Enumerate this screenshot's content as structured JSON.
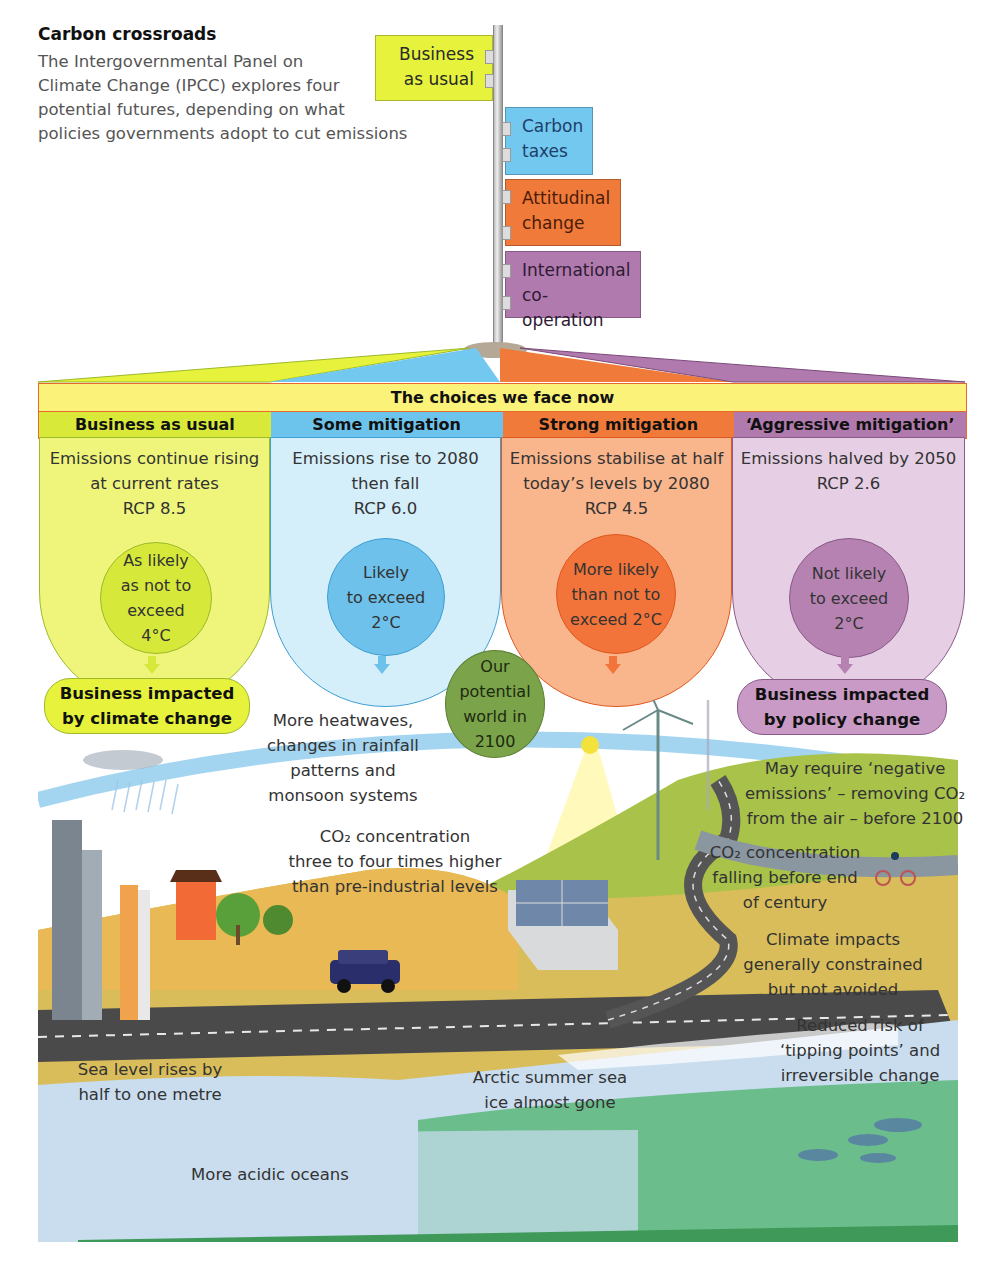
{
  "header": {
    "title": "Carbon crossroads",
    "intro_lines": [
      "The Intergovernmental Panel on",
      "Climate Change (IPCC) explores four",
      "potential futures, depending on what",
      "policies governments adopt to cut emissions"
    ]
  },
  "signpost": {
    "signs": [
      {
        "lines": [
          "Business",
          "as usual"
        ],
        "color": "#e6f23c",
        "side": "left"
      },
      {
        "lines": [
          "Carbon",
          "taxes"
        ],
        "color": "#72c8ef",
        "side": "right"
      },
      {
        "lines": [
          "Attitudinal",
          "change"
        ],
        "color": "#f07a3a",
        "side": "right"
      },
      {
        "lines": [
          "International",
          "co-operation"
        ],
        "color": "#b07aae",
        "side": "right"
      }
    ]
  },
  "choices": {
    "banner": "The choices we face now",
    "columns": [
      {
        "heading": "Business as usual",
        "description": [
          "Emissions continue rising",
          "at current rates",
          "RCP 8.5"
        ],
        "likelihood": [
          "As likely",
          "as not to",
          "exceed",
          "4°C"
        ],
        "head_color": "#d8e93a",
        "body_color": "#eef57a",
        "circle_color": "#d6e83a",
        "border_color": "#9cba2a"
      },
      {
        "heading": "Some mitigation",
        "description": [
          "Emissions rise to 2080",
          "then fall",
          "RCP 6.0"
        ],
        "likelihood": [
          "Likely",
          "to exceed",
          "2°C"
        ],
        "head_color": "#6cc3ec",
        "body_color": "#d4eefa",
        "circle_color": "#6dc1ea",
        "border_color": "#3f9fd2"
      },
      {
        "heading": "Strong mitigation",
        "description": [
          "Emissions stabilise at half",
          "today’s levels by 2080",
          "RCP 4.5"
        ],
        "likelihood": [
          "More likely",
          "than not to",
          "exceed 2°C"
        ],
        "head_color": "#f07a3a",
        "body_color": "#f9b58c",
        "circle_color": "#f2743a",
        "border_color": "#e0581f"
      },
      {
        "heading": "‘Aggressive mitigation’",
        "description": [
          "Emissions halved by 2050",
          "RCP 2.6"
        ],
        "likelihood": [
          "Not likely",
          "to exceed",
          "2°C"
        ],
        "head_color": "#b07aae",
        "body_color": "#e6cfe4",
        "circle_color": "#b582b2",
        "border_color": "#8a5a88"
      }
    ]
  },
  "outcomes": {
    "left_pill": [
      "Business impacted",
      "by climate change"
    ],
    "right_pill": [
      "Business impacted",
      "by policy change"
    ],
    "center_circle": [
      "Our",
      "potential",
      "world in",
      "2100"
    ]
  },
  "scene_notes": {
    "heatwaves": [
      "More heatwaves,",
      "changes in rainfall",
      "patterns and",
      "monsoon systems"
    ],
    "co2_high": [
      "CO₂ concentration",
      "three to four times higher",
      "than pre-industrial levels"
    ],
    "negative_emissions": [
      "May require ‘negative",
      "emissions’ – removing CO₂",
      "from the air – before 2100"
    ],
    "co2_falling": [
      "CO₂ concentration",
      "falling before end",
      "of century"
    ],
    "climate_impacts": [
      "Climate impacts",
      "generally constrained",
      "but not avoided"
    ],
    "tipping_points": [
      "Reduced risk of",
      "‘tipping points’ and",
      "irreversible change"
    ],
    "sea_level": [
      "Sea level rises by",
      "half to one metre"
    ],
    "arctic": [
      "Arctic summer sea",
      "ice almost gone"
    ],
    "acidic": [
      "More acidic oceans"
    ]
  },
  "colors": {
    "frame_border": "#e8692f",
    "banner_bg": "#fbf27a",
    "road": "#4a4a4a",
    "sand": "#e8b954",
    "hill_green": "#a8c24a",
    "ocean_light": "#c9ddef",
    "ocean_green": "#5bb77a",
    "wind_band": "#8ccbee",
    "planet_green": "#7aa34a"
  }
}
